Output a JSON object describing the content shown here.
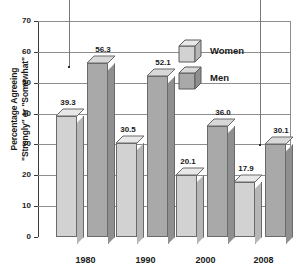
{
  "chart_data": {
    "type": "bar",
    "title": "",
    "subtitle": "",
    "xlabel": "",
    "ylabel": "Percentage Agreeing \"Strongly\" or \"Somewhat\"",
    "ylabel_lines": [
      "Percentage Agreeing",
      "\"Strongly\" or \"Somewhat\""
    ],
    "categories": [
      "1980",
      "1990",
      "2000",
      "2008"
    ],
    "series": [
      {
        "name": "Women",
        "values": [
          39.3,
          30.5,
          20.1,
          17.9
        ],
        "color": "#d2d2d2"
      },
      {
        "name": "Men",
        "values": [
          56.3,
          52.1,
          36.0,
          30.1
        ],
        "color": "#a9a9a9"
      }
    ],
    "value_labels": {
      "women": [
        "39.3",
        "30.5",
        "20.1",
        "17.9"
      ],
      "men": [
        "56.3",
        "52.1",
        "36.0",
        "30.1"
      ]
    },
    "ylim": [
      0,
      70
    ],
    "yticks": [
      0,
      10,
      20,
      30,
      40,
      50,
      60,
      70
    ],
    "ytick_labels": [
      "0",
      "10",
      "20",
      "30",
      "40",
      "50",
      "60",
      "70"
    ],
    "grid": true,
    "grid_axis": "y",
    "legend_position": "upper-right",
    "style": "3d-bar"
  },
  "legend": {
    "items": [
      {
        "label": "Women",
        "icon": "cube-light-icon"
      },
      {
        "label": "Men",
        "icon": "cube-dark-icon"
      }
    ]
  },
  "annotations": {
    "leader_lines": [
      {
        "name": "leader-line-left"
      },
      {
        "name": "leader-line-right"
      }
    ]
  },
  "colors": {
    "women_face": "#d2d2d2",
    "women_side": "#b6b6b6",
    "women_top": "#e8e8e8",
    "men_face": "#a9a9a9",
    "men_side": "#8f8f8f",
    "men_top": "#d8d8d8",
    "grid": "#8d8d8d",
    "axis": "#3a3a3a",
    "text": "#1a1a1a",
    "background": "#ffffff"
  }
}
